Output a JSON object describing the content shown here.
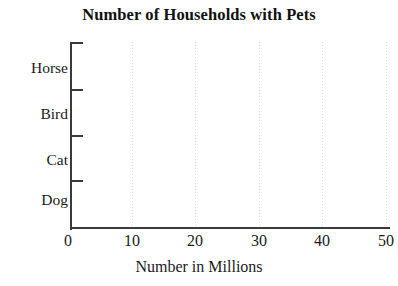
{
  "chart_data": {
    "type": "bar",
    "orientation": "horizontal",
    "title": "Number of Households with Pets",
    "subtitle": "",
    "xlabel": "Number in Millions",
    "ylabel": "",
    "categories": [
      "Horse",
      "Bird",
      "Cat",
      "Dog"
    ],
    "values": [
      null,
      null,
      null,
      null
    ],
    "series": [
      {
        "name": "Number in Millions",
        "values": [
          null,
          null,
          null,
          null
        ]
      }
    ],
    "xlim": [
      0,
      50
    ],
    "xticks": [
      0,
      10,
      20,
      30,
      40,
      50
    ],
    "xtick_labels": [
      "0",
      "10",
      "20",
      "30",
      "40",
      "50"
    ],
    "ytick_labels": [
      "Horse",
      "Bird",
      "Cat",
      "Dog"
    ],
    "grid": {
      "vertical": true,
      "horizontal": false,
      "style": "dotted",
      "color": "#d8d8d8"
    },
    "legend": {
      "visible": false,
      "position": "none",
      "entries": []
    },
    "annotations": [],
    "note": "Blank chart template: axes, gridlines and labels are drawn but no bars are plotted.",
    "colors": {
      "background": "#ffffff",
      "axis": "#3a3a3a",
      "text": "#1a1a1a",
      "grid": "#d8d8d8",
      "bar": "#555555"
    }
  },
  "geometry": {
    "gridline_left_px": [
      132,
      195,
      259,
      322,
      386
    ],
    "xlabel_left_px": [
      68,
      132,
      195,
      259,
      322,
      386
    ],
    "ytick_top_px": [
      42,
      89,
      135,
      180
    ],
    "ylabel_top_px": [
      60,
      106,
      152,
      192
    ],
    "band_bar_top_px": [
      55,
      101,
      147,
      192
    ]
  }
}
